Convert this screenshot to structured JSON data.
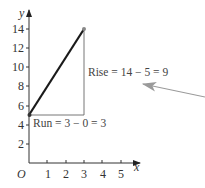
{
  "diagram": {
    "title": "",
    "axes": {
      "x_label": "x",
      "y_label": "y",
      "origin_label": "O",
      "x_ticks": [
        "1",
        "2",
        "3",
        "4",
        "5"
      ],
      "y_ticks": [
        "2",
        "4",
        "6",
        "8",
        "10",
        "12",
        "14"
      ]
    },
    "segment": {
      "from": [
        0,
        5
      ],
      "to": [
        3,
        14
      ]
    },
    "annotations": {
      "rise": "Rise = 14 − 5 = 9",
      "run": "Run = 3 − 0 = 3"
    },
    "pointer_arrow": {
      "color": "#9a9a9a"
    },
    "colors": {
      "line": "#1a1a1a",
      "axis": "#333333",
      "guide": "#666666"
    }
  }
}
